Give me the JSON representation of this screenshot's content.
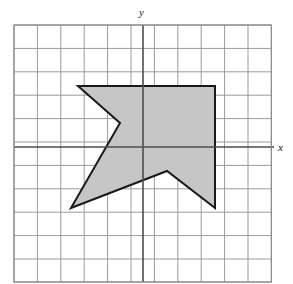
{
  "figure": {
    "kind": "coordinate-grid-polygon",
    "background_color": "#ffffff",
    "axis_labels": {
      "x": "x",
      "y": "y"
    },
    "grid": {
      "columns": 11,
      "rows": 11,
      "cell_size_px": 23.4,
      "left_px": 14,
      "top_px": 25,
      "right_px": 271.4,
      "bottom_px": 282.4,
      "minor_line_color": "#9a9a9a",
      "border_color": "#8c8c8c",
      "line_width_px": 1
    },
    "axes": {
      "origin_x_px": 143,
      "origin_y_px": 147,
      "color": "#4d4d4d",
      "line_width_px": 1.6,
      "x_axis_extends_past_grid": true,
      "x_axis_right_end_px": 274,
      "y_axis_top_end_px": 25,
      "y_axis_bottom_end_px": 282
    },
    "polygon": {
      "name": "shaded-arrow-polygon",
      "fill_color": "#c6c6c6",
      "stroke_color": "#1a1a1a",
      "stroke_width_px": 2,
      "vertices_px": [
        [
          78,
          86
        ],
        [
          215,
          86
        ],
        [
          215,
          208
        ],
        [
          167,
          171
        ],
        [
          71,
          208
        ],
        [
          120,
          123
        ]
      ],
      "vertices_grid_units": [
        [
          -2.8,
          2.6
        ],
        [
          3.1,
          2.6
        ],
        [
          3.1,
          -2.6
        ],
        [
          1.0,
          -1.0
        ],
        [
          -3.1,
          -2.6
        ],
        [
          -1.0,
          1.0
        ]
      ]
    }
  },
  "chart_data": {
    "type": "scatter",
    "title": "",
    "xlabel": "x",
    "ylabel": "y",
    "grid": true,
    "legend": "none",
    "xlim": [
      -5.5,
      5.5
    ],
    "ylim": [
      -5.8,
      5.2
    ],
    "xticks": [
      -5,
      -4,
      -3,
      -2,
      -1,
      0,
      1,
      2,
      3,
      4,
      5
    ],
    "yticks": [
      -5,
      -4,
      -3,
      -2,
      -1,
      0,
      1,
      2,
      3,
      4,
      5
    ],
    "tick_labels_shown": false,
    "series": [
      {
        "name": "shaded polygon",
        "type": "polygon",
        "closed": true,
        "fill": "#c6c6c6",
        "edge": "#1a1a1a",
        "x": [
          -2.8,
          3.1,
          3.1,
          1.0,
          -3.1,
          -1.0
        ],
        "y": [
          2.6,
          2.6,
          -2.6,
          -1.0,
          -2.6,
          1.0
        ]
      }
    ],
    "annotations": [
      {
        "text": "y",
        "x": 0,
        "y": 5.4,
        "style": "italic"
      },
      {
        "text": "x",
        "x": 5.8,
        "y": 0,
        "style": "italic"
      }
    ]
  }
}
